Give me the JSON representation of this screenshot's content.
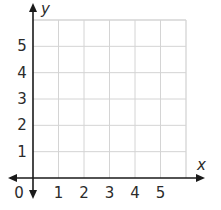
{
  "chart_data": {
    "type": "grid",
    "title": "",
    "xlabel": "x",
    "ylabel": "y",
    "origin_label": "0",
    "x_ticks": [
      "1",
      "2",
      "3",
      "4",
      "5"
    ],
    "y_ticks": [
      "1",
      "2",
      "3",
      "4",
      "5"
    ],
    "xlim": [
      0,
      6
    ],
    "ylim": [
      0,
      6
    ],
    "grid": true,
    "series": []
  },
  "colors": {
    "grid": "#d4d4d4",
    "axis": "#1a1a1a",
    "text": "#2b2b2b"
  }
}
